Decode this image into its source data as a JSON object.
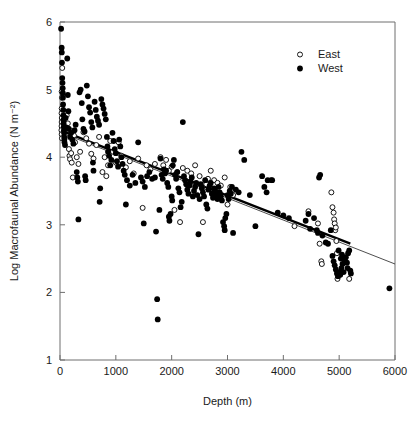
{
  "chart_data": {
    "type": "scatter",
    "title": "",
    "xlabel": "Depth (m)",
    "ylabel": "Log Macrofaunal Abundance (N m⁻²)",
    "xlim": [
      0,
      6000
    ],
    "ylim": [
      1,
      6
    ],
    "xticks": [
      0,
      1000,
      2000,
      3000,
      4000,
      5000,
      6000
    ],
    "xticklabels": [
      "0",
      "1000",
      "2000",
      "3000",
      "4000",
      "5000",
      "6000"
    ],
    "yticks": [
      1,
      2,
      3,
      4,
      5,
      6
    ],
    "yticklabels": [
      "1",
      "2",
      "3",
      "4",
      "5",
      "6"
    ],
    "grid": false,
    "legend": {
      "position": "top-right",
      "entries": [
        {
          "name": "East",
          "marker": "open-circle"
        },
        {
          "name": "West",
          "marker": "filled-circle"
        }
      ]
    },
    "series": [
      {
        "name": "East",
        "marker": "open-circle",
        "points": [
          [
            40,
            5.32
          ],
          [
            30,
            4.97
          ],
          [
            35,
            4.88
          ],
          [
            30,
            4.72
          ],
          [
            28,
            4.65
          ],
          [
            32,
            4.58
          ],
          [
            30,
            4.52
          ],
          [
            28,
            4.46
          ],
          [
            26,
            4.4
          ],
          [
            30,
            4.34
          ],
          [
            35,
            4.28
          ],
          [
            120,
            4.62
          ],
          [
            140,
            4.5
          ],
          [
            150,
            4.42
          ],
          [
            160,
            4.12
          ],
          [
            170,
            4.02
          ],
          [
            180,
            3.97
          ],
          [
            200,
            4.06
          ],
          [
            210,
            3.92
          ],
          [
            230,
            3.7
          ],
          [
            250,
            4.32
          ],
          [
            270,
            4.22
          ],
          [
            300,
            4.0
          ],
          [
            330,
            3.9
          ],
          [
            360,
            4.08
          ],
          [
            420,
            4.37
          ],
          [
            470,
            4.28
          ],
          [
            520,
            4.2
          ],
          [
            560,
            4.05
          ],
          [
            600,
            3.98
          ],
          [
            650,
            4.18
          ],
          [
            700,
            4.3
          ],
          [
            760,
            3.78
          ],
          [
            800,
            4.0
          ],
          [
            830,
            3.72
          ],
          [
            860,
            3.88
          ],
          [
            900,
            4.24
          ],
          [
            950,
            4.08
          ],
          [
            1000,
            3.92
          ],
          [
            1050,
            4.22
          ],
          [
            1100,
            4.02
          ],
          [
            1180,
            3.85
          ],
          [
            1250,
            3.94
          ],
          [
            1320,
            3.76
          ],
          [
            1400,
            3.98
          ],
          [
            1480,
            3.25
          ],
          [
            1550,
            3.88
          ],
          [
            1620,
            3.82
          ],
          [
            1700,
            3.9
          ],
          [
            1800,
            4.0
          ],
          [
            1850,
            3.88
          ],
          [
            1900,
            3.96
          ],
          [
            1950,
            3.8
          ],
          [
            2000,
            3.86
          ],
          [
            2050,
            3.22
          ],
          [
            2100,
            3.78
          ],
          [
            2150,
            3.04
          ],
          [
            2200,
            3.84
          ],
          [
            2280,
            3.8
          ],
          [
            2350,
            3.76
          ],
          [
            2420,
            3.88
          ],
          [
            2500,
            3.72
          ],
          [
            2560,
            3.04
          ],
          [
            2620,
            3.6
          ],
          [
            2650,
            3.68
          ],
          [
            2700,
            3.8
          ],
          [
            2760,
            3.66
          ],
          [
            2820,
            3.62
          ],
          [
            2880,
            3.58
          ],
          [
            2950,
            3.7
          ],
          [
            3000,
            3.3
          ],
          [
            3050,
            3.56
          ],
          [
            3100,
            3.44
          ],
          [
            3780,
            3.66
          ],
          [
            4200,
            2.98
          ],
          [
            4450,
            3.2
          ],
          [
            4620,
            3.02
          ],
          [
            4650,
            2.72
          ],
          [
            4680,
            2.46
          ],
          [
            4690,
            2.42
          ],
          [
            4860,
            3.48
          ],
          [
            4880,
            3.26
          ],
          [
            4900,
            3.18
          ],
          [
            4910,
            3.08
          ],
          [
            4920,
            3.02
          ],
          [
            4930,
            2.92
          ],
          [
            4940,
            2.96
          ],
          [
            4950,
            2.76
          ],
          [
            4960,
            2.58
          ],
          [
            4970,
            2.2
          ],
          [
            5180,
            2.2
          ]
        ]
      },
      {
        "name": "West",
        "marker": "filled-circle",
        "points": [
          [
            20,
            5.9
          ],
          [
            30,
            5.62
          ],
          [
            32,
            5.55
          ],
          [
            35,
            5.4
          ],
          [
            40,
            5.17
          ],
          [
            45,
            5.1
          ],
          [
            48,
            5.02
          ],
          [
            50,
            4.95
          ],
          [
            52,
            4.88
          ],
          [
            55,
            4.78
          ],
          [
            58,
            4.7
          ],
          [
            60,
            4.62
          ],
          [
            62,
            4.55
          ],
          [
            65,
            4.5
          ],
          [
            68,
            4.45
          ],
          [
            70,
            4.4
          ],
          [
            72,
            4.36
          ],
          [
            75,
            4.3
          ],
          [
            78,
            4.26
          ],
          [
            80,
            4.22
          ],
          [
            90,
            4.18
          ],
          [
            100,
            4.58
          ],
          [
            110,
            4.44
          ],
          [
            130,
            5.46
          ],
          [
            140,
            4.92
          ],
          [
            150,
            4.68
          ],
          [
            160,
            4.42
          ],
          [
            180,
            4.3
          ],
          [
            200,
            4.36
          ],
          [
            220,
            4.26
          ],
          [
            240,
            4.2
          ],
          [
            260,
            4.4
          ],
          [
            280,
            4.48
          ],
          [
            300,
            3.78
          ],
          [
            310,
            3.7
          ],
          [
            320,
            3.64
          ],
          [
            330,
            3.08
          ],
          [
            350,
            4.96
          ],
          [
            370,
            5.0
          ],
          [
            390,
            4.8
          ],
          [
            400,
            4.56
          ],
          [
            420,
            4.42
          ],
          [
            440,
            4.38
          ],
          [
            450,
            3.72
          ],
          [
            460,
            3.66
          ],
          [
            480,
            5.06
          ],
          [
            500,
            4.9
          ],
          [
            520,
            4.74
          ],
          [
            540,
            4.66
          ],
          [
            560,
            4.52
          ],
          [
            580,
            4.44
          ],
          [
            590,
            3.92
          ],
          [
            600,
            3.8
          ],
          [
            620,
            4.82
          ],
          [
            640,
            4.7
          ],
          [
            660,
            4.6
          ],
          [
            680,
            4.54
          ],
          [
            700,
            4.48
          ],
          [
            710,
            3.34
          ],
          [
            720,
            3.54
          ],
          [
            740,
            4.86
          ],
          [
            760,
            4.78
          ],
          [
            780,
            4.72
          ],
          [
            800,
            4.64
          ],
          [
            820,
            4.56
          ],
          [
            840,
            4.3
          ],
          [
            850,
            4.16
          ],
          [
            860,
            4.08
          ],
          [
            880,
            4.02
          ],
          [
            900,
            3.88
          ],
          [
            920,
            3.96
          ],
          [
            940,
            4.36
          ],
          [
            960,
            4.24
          ],
          [
            980,
            4.12
          ],
          [
            1000,
            4.06
          ],
          [
            1020,
            3.94
          ],
          [
            1040,
            3.86
          ],
          [
            1060,
            4.26
          ],
          [
            1080,
            4.16
          ],
          [
            1100,
            4.0
          ],
          [
            1120,
            3.9
          ],
          [
            1140,
            3.8
          ],
          [
            1160,
            3.74
          ],
          [
            1180,
            3.3
          ],
          [
            1200,
            3.66
          ],
          [
            1250,
            3.58
          ],
          [
            1300,
            3.74
          ],
          [
            1350,
            3.62
          ],
          [
            1400,
            4.22
          ],
          [
            1450,
            3.7
          ],
          [
            1480,
            3.64
          ],
          [
            1500,
            3.02
          ],
          [
            1520,
            3.56
          ],
          [
            1560,
            3.72
          ],
          [
            1600,
            3.78
          ],
          [
            1650,
            3.68
          ],
          [
            1700,
            3.7
          ],
          [
            1720,
            2.9
          ],
          [
            1740,
            1.9
          ],
          [
            1750,
            1.6
          ],
          [
            1780,
            3.22
          ],
          [
            1800,
            3.98
          ],
          [
            1820,
            3.74
          ],
          [
            1840,
            3.68
          ],
          [
            1860,
            3.82
          ],
          [
            1880,
            3.76
          ],
          [
            1900,
            3.8
          ],
          [
            1920,
            3.62
          ],
          [
            1940,
            3.56
          ],
          [
            1950,
            3.12
          ],
          [
            1960,
            3.06
          ],
          [
            1980,
            3.16
          ],
          [
            2000,
            3.42
          ],
          [
            2010,
            3.36
          ],
          [
            2020,
            3.88
          ],
          [
            2040,
            3.96
          ],
          [
            2060,
            3.74
          ],
          [
            2080,
            3.68
          ],
          [
            2100,
            3.78
          ],
          [
            2120,
            3.54
          ],
          [
            2140,
            3.48
          ],
          [
            2160,
            3.26
          ],
          [
            2180,
            3.34
          ],
          [
            2200,
            4.52
          ],
          [
            2220,
            3.72
          ],
          [
            2240,
            3.66
          ],
          [
            2260,
            3.6
          ],
          [
            2280,
            3.52
          ],
          [
            2300,
            3.46
          ],
          [
            2320,
            3.58
          ],
          [
            2340,
            3.64
          ],
          [
            2360,
            3.7
          ],
          [
            2380,
            3.42
          ],
          [
            2400,
            3.5
          ],
          [
            2420,
            3.56
          ],
          [
            2440,
            3.62
          ],
          [
            2460,
            3.44
          ],
          [
            2480,
            2.86
          ],
          [
            2500,
            3.38
          ],
          [
            2520,
            3.6
          ],
          [
            2540,
            3.54
          ],
          [
            2560,
            3.48
          ],
          [
            2580,
            3.42
          ],
          [
            2600,
            3.66
          ],
          [
            2620,
            3.3
          ],
          [
            2640,
            3.24
          ],
          [
            2660,
            3.52
          ],
          [
            2680,
            3.58
          ],
          [
            2700,
            3.62
          ],
          [
            2720,
            3.46
          ],
          [
            2740,
            3.4
          ],
          [
            2760,
            3.54
          ],
          [
            2780,
            3.5
          ],
          [
            2800,
            3.44
          ],
          [
            2820,
            3.38
          ],
          [
            2840,
            3.56
          ],
          [
            2860,
            3.48
          ],
          [
            2880,
            3.42
          ],
          [
            2900,
            3.36
          ],
          [
            2920,
            3.04
          ],
          [
            2940,
            2.98
          ],
          [
            2950,
            2.92
          ],
          [
            2960,
            3.1
          ],
          [
            2980,
            3.16
          ],
          [
            3000,
            3.44
          ],
          [
            3020,
            3.38
          ],
          [
            3040,
            3.5
          ],
          [
            3060,
            3.46
          ],
          [
            3080,
            3.56
          ],
          [
            3100,
            2.88
          ],
          [
            3150,
            3.52
          ],
          [
            3200,
            3.48
          ],
          [
            3250,
            4.08
          ],
          [
            3300,
            3.96
          ],
          [
            3400,
            3.44
          ],
          [
            3500,
            2.98
          ],
          [
            3620,
            3.72
          ],
          [
            3660,
            3.56
          ],
          [
            3700,
            3.48
          ],
          [
            3720,
            3.66
          ],
          [
            3800,
            3.66
          ],
          [
            3900,
            3.18
          ],
          [
            4000,
            3.14
          ],
          [
            4100,
            3.1
          ],
          [
            4400,
            3.06
          ],
          [
            4450,
            3.16
          ],
          [
            4480,
            2.94
          ],
          [
            4550,
            3.1
          ],
          [
            4600,
            2.92
          ],
          [
            4620,
            2.88
          ],
          [
            4640,
            3.7
          ],
          [
            4660,
            3.74
          ],
          [
            4700,
            2.84
          ],
          [
            4760,
            2.74
          ],
          [
            4800,
            2.72
          ],
          [
            4850,
            2.92
          ],
          [
            4880,
            2.54
          ],
          [
            4900,
            2.46
          ],
          [
            4920,
            2.4
          ],
          [
            4940,
            2.34
          ],
          [
            4960,
            2.28
          ],
          [
            4980,
            2.24
          ],
          [
            5000,
            2.3
          ],
          [
            5020,
            2.26
          ],
          [
            5040,
            2.36
          ],
          [
            5060,
            2.42
          ],
          [
            5080,
            2.3
          ],
          [
            5100,
            2.48
          ],
          [
            5120,
            2.52
          ],
          [
            5140,
            2.44
          ],
          [
            5150,
            2.36
          ],
          [
            5160,
            2.58
          ],
          [
            5180,
            2.62
          ],
          [
            5200,
            2.32
          ],
          [
            5210,
            2.28
          ],
          [
            5050,
            2.56
          ],
          [
            5030,
            2.5
          ],
          [
            4990,
            2.62
          ],
          [
            5900,
            2.06
          ]
        ]
      }
    ],
    "fit_lines": [
      {
        "name": "West",
        "style": "thick",
        "x": [
          0,
          5200
        ],
        "y": [
          4.4,
          2.72
        ]
      },
      {
        "name": "East",
        "style": "thin",
        "x": [
          0,
          6000
        ],
        "y": [
          4.37,
          2.42
        ]
      }
    ]
  }
}
